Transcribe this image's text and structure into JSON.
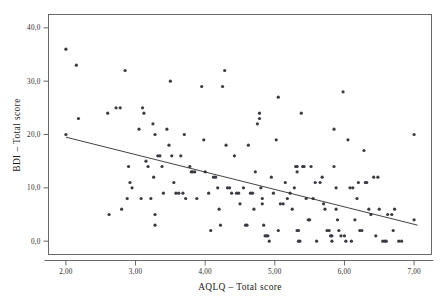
{
  "chart_data": {
    "type": "scatter",
    "title": "",
    "xlabel": "AQLQ – Total score",
    "ylabel": "BDI – Total score",
    "xlim": [
      1.75,
      7.25
    ],
    "ylim": [
      -2.5,
      42.5
    ],
    "xticks": [
      "2,00",
      "3,00",
      "4,00",
      "5,00",
      "6,00",
      "7,00"
    ],
    "xtick_values": [
      2,
      3,
      4,
      5,
      6,
      7
    ],
    "yticks": [
      "0,0",
      "10,0",
      "20,0",
      "30,0",
      "40,0"
    ],
    "ytick_values": [
      0,
      10,
      20,
      30,
      40
    ],
    "grid": false,
    "legend": "none",
    "marker_color": "#3a3a42",
    "line_color": "#2c2c2c",
    "frame_color": "#595959",
    "fit_line": {
      "label": "linear fit",
      "x_start": 2.0,
      "y_start": 19.5,
      "x_end": 7.05,
      "y_end": 3.0
    },
    "points": [
      [
        2.0,
        36.0
      ],
      [
        2.0,
        20.0
      ],
      [
        2.15,
        33.0
      ],
      [
        2.18,
        23.0
      ],
      [
        2.6,
        24.0
      ],
      [
        2.62,
        5.0
      ],
      [
        2.72,
        25.0
      ],
      [
        2.78,
        25.0
      ],
      [
        2.8,
        6.0
      ],
      [
        2.85,
        32.0
      ],
      [
        2.88,
        8.0
      ],
      [
        2.9,
        14.0
      ],
      [
        2.92,
        11.0
      ],
      [
        2.95,
        10.0
      ],
      [
        3.05,
        21.0
      ],
      [
        3.08,
        8.0
      ],
      [
        3.1,
        25.0
      ],
      [
        3.12,
        24.0
      ],
      [
        3.15,
        15.0
      ],
      [
        3.18,
        14.0
      ],
      [
        3.22,
        8.0
      ],
      [
        3.25,
        22.0
      ],
      [
        3.26,
        12.0
      ],
      [
        3.28,
        20.0
      ],
      [
        3.28,
        5.0
      ],
      [
        3.28,
        3.0
      ],
      [
        3.32,
        16.0
      ],
      [
        3.35,
        16.0
      ],
      [
        3.38,
        14.0
      ],
      [
        3.4,
        9.0
      ],
      [
        3.45,
        21.0
      ],
      [
        3.48,
        18.0
      ],
      [
        3.5,
        30.0
      ],
      [
        3.52,
        16.0
      ],
      [
        3.55,
        11.0
      ],
      [
        3.58,
        9.0
      ],
      [
        3.62,
        9.0
      ],
      [
        3.65,
        16.0
      ],
      [
        3.68,
        9.0
      ],
      [
        3.7,
        20.0
      ],
      [
        3.72,
        8.0
      ],
      [
        3.78,
        14.0
      ],
      [
        3.8,
        13.0
      ],
      [
        3.82,
        13.0
      ],
      [
        3.85,
        13.0
      ],
      [
        3.88,
        8.0
      ],
      [
        3.95,
        29.0
      ],
      [
        3.98,
        19.0
      ],
      [
        4.0,
        13.0
      ],
      [
        4.05,
        9.0
      ],
      [
        4.08,
        2.0
      ],
      [
        4.12,
        12.0
      ],
      [
        4.15,
        12.0
      ],
      [
        4.18,
        10.0
      ],
      [
        4.2,
        6.0
      ],
      [
        4.22,
        3.0
      ],
      [
        4.25,
        29.0
      ],
      [
        4.28,
        32.0
      ],
      [
        4.3,
        18.0
      ],
      [
        4.32,
        10.0
      ],
      [
        4.35,
        10.0
      ],
      [
        4.38,
        9.0
      ],
      [
        4.42,
        16.0
      ],
      [
        4.45,
        9.0
      ],
      [
        4.48,
        9.0
      ],
      [
        4.5,
        7.0
      ],
      [
        4.55,
        10.0
      ],
      [
        4.58,
        3.0
      ],
      [
        4.6,
        3.0
      ],
      [
        4.62,
        18.0
      ],
      [
        4.65,
        9.0
      ],
      [
        4.68,
        9.0
      ],
      [
        4.7,
        6.0
      ],
      [
        4.72,
        13.0
      ],
      [
        4.75,
        22.0
      ],
      [
        4.78,
        23.0
      ],
      [
        4.78,
        24.0
      ],
      [
        4.8,
        10.0
      ],
      [
        4.82,
        8.0
      ],
      [
        4.82,
        7.0
      ],
      [
        4.84,
        3.0
      ],
      [
        4.86,
        1.0
      ],
      [
        4.88,
        1.0
      ],
      [
        4.9,
        1.0
      ],
      [
        4.92,
        0.0
      ],
      [
        4.95,
        12.0
      ],
      [
        4.98,
        9.0
      ],
      [
        5.02,
        19.0
      ],
      [
        5.05,
        27.0
      ],
      [
        5.05,
        2.0
      ],
      [
        5.08,
        7.0
      ],
      [
        5.12,
        7.0
      ],
      [
        5.15,
        11.0
      ],
      [
        5.18,
        8.0
      ],
      [
        5.22,
        9.0
      ],
      [
        5.25,
        6.0
      ],
      [
        5.28,
        10.0
      ],
      [
        5.3,
        14.0
      ],
      [
        5.32,
        14.0
      ],
      [
        5.32,
        13.0
      ],
      [
        5.32,
        2.0
      ],
      [
        5.34,
        2.0
      ],
      [
        5.34,
        0.0
      ],
      [
        5.36,
        0.0
      ],
      [
        5.38,
        24.0
      ],
      [
        5.4,
        14.0
      ],
      [
        5.42,
        14.0
      ],
      [
        5.45,
        8.0
      ],
      [
        5.48,
        4.0
      ],
      [
        5.5,
        4.0
      ],
      [
        5.52,
        14.0
      ],
      [
        5.55,
        8.0
      ],
      [
        5.58,
        11.0
      ],
      [
        5.6,
        0.0
      ],
      [
        5.65,
        11.0
      ],
      [
        5.68,
        12.0
      ],
      [
        5.7,
        7.0
      ],
      [
        5.72,
        6.0
      ],
      [
        5.75,
        2.0
      ],
      [
        5.78,
        2.0
      ],
      [
        5.8,
        1.0
      ],
      [
        5.82,
        1.0
      ],
      [
        5.82,
        0.0
      ],
      [
        5.85,
        21.0
      ],
      [
        5.85,
        14.0
      ],
      [
        5.88,
        10.0
      ],
      [
        5.88,
        6.0
      ],
      [
        5.9,
        4.0
      ],
      [
        5.92,
        2.0
      ],
      [
        5.95,
        1.0
      ],
      [
        5.98,
        28.0
      ],
      [
        6.0,
        1.0
      ],
      [
        6.02,
        0.0
      ],
      [
        6.05,
        19.0
      ],
      [
        6.08,
        10.0
      ],
      [
        6.1,
        0.0
      ],
      [
        6.12,
        10.0
      ],
      [
        6.15,
        4.0
      ],
      [
        6.18,
        8.0
      ],
      [
        6.2,
        11.0
      ],
      [
        6.22,
        2.0
      ],
      [
        6.25,
        2.0
      ],
      [
        6.28,
        17.0
      ],
      [
        6.3,
        11.0
      ],
      [
        6.32,
        11.0
      ],
      [
        6.35,
        6.0
      ],
      [
        6.38,
        5.0
      ],
      [
        6.42,
        12.0
      ],
      [
        6.45,
        1.0
      ],
      [
        6.48,
        12.0
      ],
      [
        6.5,
        6.0
      ],
      [
        6.55,
        0.0
      ],
      [
        6.58,
        0.0
      ],
      [
        6.6,
        0.0
      ],
      [
        6.62,
        5.0
      ],
      [
        6.68,
        5.0
      ],
      [
        6.7,
        2.0
      ],
      [
        6.72,
        6.0
      ],
      [
        6.78,
        0.0
      ],
      [
        6.82,
        0.0
      ],
      [
        7.0,
        20.0
      ],
      [
        7.0,
        4.0
      ]
    ]
  }
}
